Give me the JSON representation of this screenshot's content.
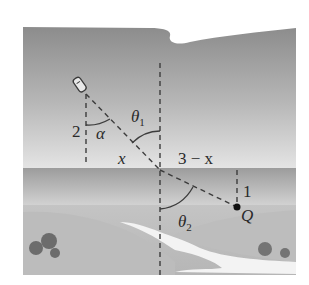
{
  "diagram": {
    "type": "geometry-illustration",
    "colors": {
      "background": "#ffffff",
      "water_top": "#8e8e8e",
      "water_bottom": "#e2e2e2",
      "shore_band": "#a9a9a9",
      "land": "#c8c8c8",
      "land_dark": "#b4b4b4",
      "path_white": "#f4f4f4",
      "bush": "#6e6e6e",
      "line": "#3c3c3c",
      "text": "#2a2a2a"
    },
    "labels": {
      "side_left": "2",
      "angle_alpha": "α",
      "theta": "θ",
      "theta1_sub": "1",
      "theta2_sub": "2",
      "segment_x": "x",
      "segment_rest": "3 − x",
      "side_right": "1",
      "point": "Q"
    },
    "nodes": {
      "boat": {
        "x": 80,
        "y": 85
      },
      "boat_foot": {
        "x": 86,
        "y": 94
      },
      "shore_crossing": {
        "x": 160,
        "y": 170
      },
      "point_Q": {
        "x": 237,
        "y": 207
      }
    }
  }
}
